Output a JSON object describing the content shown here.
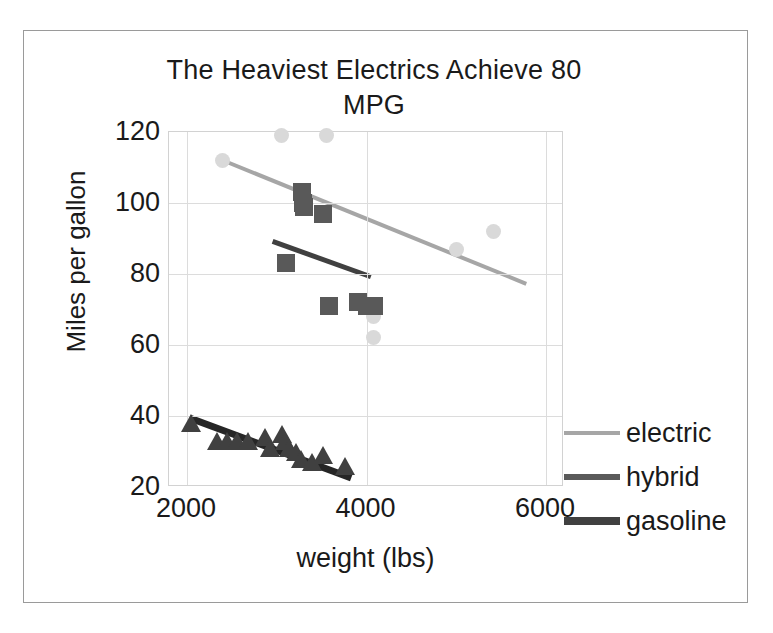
{
  "chart_data": {
    "type": "scatter",
    "title": "The Heaviest Electrics Achieve 80 MPG",
    "xlabel": "weight (lbs)",
    "ylabel": "Miles per gallon",
    "xlim": [
      1800,
      6200
    ],
    "ylim": [
      20,
      120
    ],
    "xticks": [
      "2000",
      "4000",
      "6000"
    ],
    "xtick_values": [
      2000,
      4000,
      6000
    ],
    "yticks": [
      "20",
      "40",
      "60",
      "80",
      "100",
      "120"
    ],
    "ytick_values": [
      20,
      40,
      60,
      80,
      100,
      120
    ],
    "grid": true,
    "legend_position": "right",
    "colors": {
      "electric": "#d9d9d9",
      "hybrid": "#595959",
      "gasoline": "#404040",
      "electric_trend": "#a6a6a6",
      "hybrid_trend": "#404040",
      "gasoline_trend": "#262626",
      "gridline": "#dcdcdc",
      "axis": "#d2d2d2",
      "frame": "#9a9a9a",
      "text": "#1a1a1a"
    },
    "series": [
      {
        "name": "electric",
        "marker": "circle",
        "color": "#d9d9d9",
        "points": [
          {
            "x": 2400,
            "y": 112
          },
          {
            "x": 3050,
            "y": 119
          },
          {
            "x": 3550,
            "y": 119
          },
          {
            "x": 4080,
            "y": 68
          },
          {
            "x": 4080,
            "y": 62
          },
          {
            "x": 5000,
            "y": 87
          },
          {
            "x": 5420,
            "y": 92
          }
        ],
        "trend": {
          "x1": 2400,
          "y1": 112,
          "x2": 5800,
          "y2": 77
        }
      },
      {
        "name": "hybrid",
        "marker": "square",
        "color": "#595959",
        "points": [
          {
            "x": 3100,
            "y": 83
          },
          {
            "x": 3280,
            "y": 103
          },
          {
            "x": 3290,
            "y": 100
          },
          {
            "x": 3300,
            "y": 99
          },
          {
            "x": 3520,
            "y": 97
          },
          {
            "x": 3580,
            "y": 71
          },
          {
            "x": 3900,
            "y": 72
          },
          {
            "x": 4010,
            "y": 71
          },
          {
            "x": 4080,
            "y": 71
          }
        ],
        "trend": {
          "x1": 2960,
          "y1": 89,
          "x2": 4060,
          "y2": 79
        }
      },
      {
        "name": "gasoline",
        "marker": "triangle",
        "color": "#404040",
        "points": [
          {
            "x": 2050,
            "y": 38
          },
          {
            "x": 2330,
            "y": 33
          },
          {
            "x": 2450,
            "y": 33
          },
          {
            "x": 2560,
            "y": 33
          },
          {
            "x": 2680,
            "y": 33
          },
          {
            "x": 2870,
            "y": 34
          },
          {
            "x": 2930,
            "y": 31
          },
          {
            "x": 3060,
            "y": 35
          },
          {
            "x": 3090,
            "y": 33
          },
          {
            "x": 3140,
            "y": 31
          },
          {
            "x": 3210,
            "y": 30
          },
          {
            "x": 3270,
            "y": 28
          },
          {
            "x": 3390,
            "y": 27
          },
          {
            "x": 3520,
            "y": 29
          },
          {
            "x": 3760,
            "y": 26
          }
        ],
        "trend": {
          "x1": 2030,
          "y1": 39,
          "x2": 3840,
          "y2": 22
        }
      }
    ]
  },
  "legend": {
    "items": [
      {
        "label": "electric",
        "color": "#a6a6a6",
        "thickness": 4
      },
      {
        "label": "hybrid",
        "color": "#5a5a5a",
        "thickness": 6
      },
      {
        "label": "gasoline",
        "color": "#404040",
        "thickness": 8
      }
    ]
  }
}
